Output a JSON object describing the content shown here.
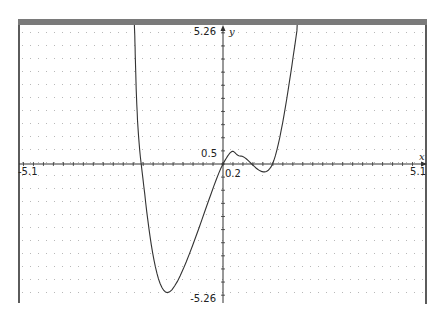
{
  "chart_data": {
    "type": "line",
    "title": "",
    "xlabel": "x",
    "ylabel": "y",
    "xlim": [
      -5.1,
      5.1
    ],
    "ylim": [
      -5.26,
      5.26
    ],
    "grid": "dotted",
    "x_tick_step": 0.25,
    "y_tick_step": 0.5,
    "tick_labels": {
      "x_min": "-5.1",
      "x_max": "5.1",
      "x_scale": "0.2",
      "y_max": "5.26",
      "y_min": "-5.26",
      "y_scale": "0.5"
    },
    "series": [
      {
        "name": "f(x)",
        "description": "quartic curve: crosses zero near x=-2.05 and x=0, local max ~0.3 near x=0.45, touches zero near x=1.24, global min ~-4.9 near x=-1.39",
        "key_points": [
          {
            "x": -2.22,
            "y": 5.26
          },
          {
            "x": -2.05,
            "y": 0
          },
          {
            "x": -1.39,
            "y": -4.9
          },
          {
            "x": 0,
            "y": 0
          },
          {
            "x": 0.45,
            "y": 0.3
          },
          {
            "x": 1.24,
            "y": 0
          },
          {
            "x": 1.87,
            "y": 5.26
          }
        ],
        "color": "#333333"
      }
    ]
  },
  "frame": {
    "top_bar_color": "#7a7a7a",
    "border_color": "#333333",
    "grid_dot_color": "#b8b8b8"
  }
}
